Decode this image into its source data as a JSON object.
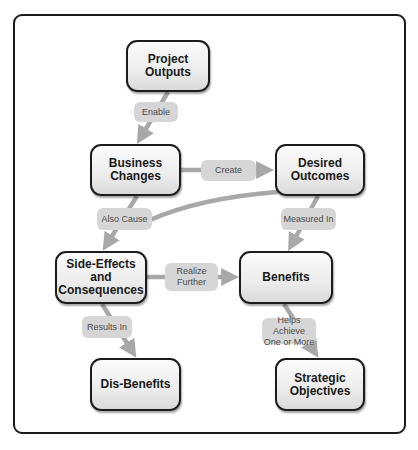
{
  "diagram": {
    "nodes": {
      "project_outputs": "Project\nOutputs",
      "business_changes": "Business\nChanges",
      "desired_outcomes": "Desired\nOutcomes",
      "side_effects": "Side-Effects\nand\nConsequences",
      "benefits": "Benefits",
      "dis_benefits": "Dis-Benefits",
      "strategic_objectives": "Strategic\nObjectives"
    },
    "edges": {
      "enable": "Enable",
      "create": "Create",
      "also_cause": "Also Cause",
      "measured_in": "Measured In",
      "realize_further": "Realize\nFurther",
      "results_in": "Results In",
      "helps_achieve": "Helps Achieve\nOne or More"
    },
    "colors": {
      "node_border": "#1c1c1c",
      "node_fill": "#ececec",
      "edge": "#a8a8a8",
      "label_fill": "#d6d6d6",
      "label_text": "#4a4a4a"
    }
  }
}
